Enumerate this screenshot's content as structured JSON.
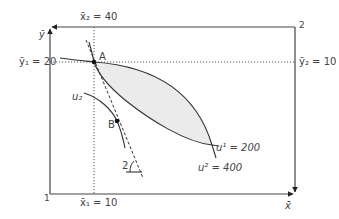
{
  "diagram": {
    "type": "edgeworth-box",
    "origins": {
      "consumer1": "1",
      "consumer2": "2"
    },
    "axes": {
      "x_label": "x̄",
      "y_label": "ȳ"
    },
    "endowment_labels": {
      "x1": "x̄₁ = 10",
      "x2": "x̄₂ = 40",
      "y1": "ȳ₁ = 20",
      "y2": "ȳ₂ = 10"
    },
    "points": [
      {
        "label": "A"
      },
      {
        "label": "B"
      }
    ],
    "curves": {
      "u1": "u¹ = 200",
      "u2_upper": "u² = 400",
      "u2_lower": "u₂"
    },
    "angle_label": "2",
    "colors": {
      "line": "#3a3a3a",
      "dotted": "#555555",
      "lens_fill": "#ebebeb"
    }
  }
}
